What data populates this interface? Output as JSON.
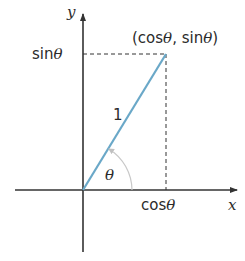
{
  "diagram": {
    "colors": {
      "axis": "#333333",
      "radius": "#6aa8c8",
      "dashed": "#333333",
      "arc": "#c8c8c8",
      "text": "#2b2b2b"
    },
    "labels": {
      "y_axis": "y",
      "x_axis": "x",
      "point": "(cosθ, sinθ)",
      "sin": "sinθ",
      "cos": "cosθ",
      "radius": "1",
      "angle": "θ"
    }
  }
}
